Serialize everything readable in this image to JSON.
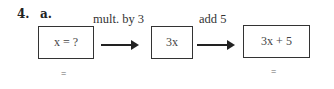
{
  "problem": {
    "number": "4.",
    "part": "a."
  },
  "steps": [
    {
      "box": "x = ?",
      "below": "="
    },
    {
      "operation": "mult. by 3",
      "box": "3x"
    },
    {
      "operation": "add 5",
      "box": "3x + 5",
      "below": "="
    }
  ]
}
